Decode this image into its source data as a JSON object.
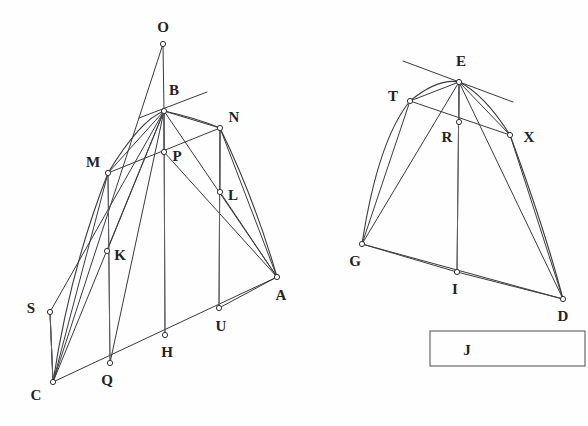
{
  "figure": {
    "background_color": "#fefefe",
    "stroke_color": "#3a3a3f",
    "label_color": "#232327",
    "width": 588,
    "height": 426
  },
  "left_figure": {
    "name": "left-construction",
    "points": [
      {
        "id": "O",
        "label": "O",
        "x": 163,
        "y": 44,
        "label_x": 163,
        "label_y": 32,
        "marker": true
      },
      {
        "id": "B",
        "label": "B",
        "x": 164,
        "y": 111,
        "label_x": 174,
        "label_y": 95,
        "marker": true
      },
      {
        "id": "N",
        "label": "N",
        "x": 220,
        "y": 128,
        "label_x": 234,
        "label_y": 122,
        "marker": true
      },
      {
        "id": "M",
        "label": "M",
        "x": 108,
        "y": 173,
        "label_x": 93,
        "label_y": 167,
        "marker": true
      },
      {
        "id": "P",
        "label": "P",
        "x": 164,
        "y": 152,
        "label_x": 177,
        "label_y": 161,
        "marker": true
      },
      {
        "id": "L",
        "label": "L",
        "x": 220,
        "y": 192,
        "label_x": 233,
        "label_y": 200,
        "marker": true
      },
      {
        "id": "K",
        "label": "K",
        "x": 107,
        "y": 251,
        "label_x": 120,
        "label_y": 260,
        "marker": true
      },
      {
        "id": "A",
        "label": "A",
        "x": 277,
        "y": 277,
        "label_x": 281,
        "label_y": 300,
        "marker": true
      },
      {
        "id": "S",
        "label": "S",
        "x": 50,
        "y": 312,
        "label_x": 31,
        "label_y": 313,
        "marker": true
      },
      {
        "id": "U",
        "label": "U",
        "x": 219,
        "y": 308,
        "label_x": 221,
        "label_y": 331,
        "marker": true
      },
      {
        "id": "H",
        "label": "H",
        "x": 165,
        "y": 335,
        "label_x": 167,
        "label_y": 357,
        "marker": true
      },
      {
        "id": "Q",
        "label": "Q",
        "x": 110,
        "y": 363,
        "label_x": 107,
        "label_y": 385,
        "marker": true
      },
      {
        "id": "C",
        "label": "C",
        "x": 53,
        "y": 382,
        "label_x": 36,
        "label_y": 400,
        "marker": true
      }
    ],
    "segments": [
      [
        "O",
        "C"
      ],
      [
        "O",
        "B"
      ],
      [
        "B",
        "H"
      ],
      [
        "B",
        "M"
      ],
      [
        "B",
        "N"
      ],
      [
        "B",
        "P"
      ],
      [
        "B",
        "K"
      ],
      [
        "B",
        "Q"
      ],
      [
        "B",
        "C"
      ],
      [
        "B",
        "A"
      ],
      [
        "B",
        "S"
      ],
      [
        "M",
        "N"
      ],
      [
        "M",
        "C"
      ],
      [
        "M",
        "Q"
      ],
      [
        "N",
        "U"
      ],
      [
        "N",
        "A"
      ],
      [
        "N",
        "L"
      ],
      [
        "L",
        "A"
      ],
      [
        "C",
        "A"
      ],
      [
        "C",
        "S"
      ],
      [
        "S",
        "C"
      ],
      [
        "U",
        "A"
      ],
      [
        "P",
        "A"
      ]
    ],
    "vertical_lines": [
      [
        "M",
        "Q"
      ],
      [
        "B",
        "H"
      ],
      [
        "N",
        "U"
      ],
      [
        "S",
        "C"
      ]
    ],
    "curve": {
      "description": "parabolic arc from C through M, B, N to A",
      "path": "M 53 382 Q 70 270 108 173 Q 140 120 164 111 Q 196 118 220 128 Q 255 200 277 277"
    },
    "tangent_at_B": {
      "x1": 139,
      "y1": 118,
      "x2": 207,
      "y2": 92
    }
  },
  "right_figure": {
    "name": "right-construction",
    "points": [
      {
        "id": "E",
        "label": "E",
        "x": 459,
        "y": 82,
        "label_x": 461,
        "label_y": 66,
        "marker": true
      },
      {
        "id": "T",
        "label": "T",
        "x": 410,
        "y": 101,
        "label_x": 393,
        "label_y": 101,
        "marker": true
      },
      {
        "id": "R",
        "label": "R",
        "x": 459,
        "y": 122,
        "label_x": 447,
        "label_y": 142,
        "marker": true
      },
      {
        "id": "X",
        "label": "X",
        "x": 510,
        "y": 135,
        "label_x": 529,
        "label_y": 142,
        "marker": true
      },
      {
        "id": "G",
        "label": "G",
        "x": 362,
        "y": 244,
        "label_x": 355,
        "label_y": 266,
        "marker": true
      },
      {
        "id": "I",
        "label": "I",
        "x": 457,
        "y": 272,
        "label_x": 455,
        "label_y": 294,
        "marker": true
      },
      {
        "id": "D",
        "label": "D",
        "x": 563,
        "y": 299,
        "label_x": 563,
        "label_y": 321,
        "marker": true
      }
    ],
    "segments": [
      [
        "E",
        "G"
      ],
      [
        "E",
        "D"
      ],
      [
        "E",
        "I"
      ],
      [
        "E",
        "T"
      ],
      [
        "E",
        "X"
      ],
      [
        "E",
        "R"
      ],
      [
        "T",
        "X"
      ],
      [
        "G",
        "D"
      ],
      [
        "T",
        "G"
      ],
      [
        "X",
        "D"
      ],
      [
        "G",
        "I"
      ],
      [
        "I",
        "D"
      ]
    ],
    "vertical_lines": [
      [
        "E",
        "I"
      ]
    ],
    "curve": {
      "description": "parabolic arc from G through T, E, X to D",
      "path": "M 362 244 Q 378 140 410 101 Q 438 78 459 82 Q 484 94 510 135 Q 545 230 563 299"
    },
    "tangent_at_E": {
      "x1": 403,
      "y1": 61,
      "x2": 513,
      "y2": 102
    }
  },
  "legend_box": {
    "name": "legend-box",
    "label": "J",
    "x": 430,
    "y": 331,
    "width": 155,
    "height": 35,
    "label_x": 467,
    "label_y": 355
  }
}
